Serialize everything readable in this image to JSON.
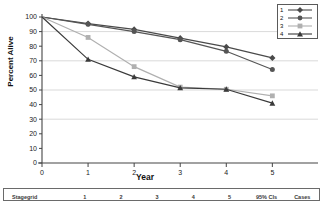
{
  "chart_data": {
    "type": "line",
    "title": "",
    "xlabel": "Year",
    "ylabel": "Percent Alive",
    "x": [
      0,
      1,
      2,
      3,
      4,
      5
    ],
    "xlim": [
      0,
      5.6
    ],
    "ylim": [
      0,
      100
    ],
    "xticks": [
      "0",
      "1",
      "2",
      "3",
      "4",
      "5"
    ],
    "yticks": [
      "0",
      "10",
      "20",
      "30",
      "40",
      "50",
      "60",
      "70",
      "80",
      "90",
      "100"
    ],
    "grid": true,
    "legend_position": "top-right",
    "series": [
      {
        "name": "1",
        "marker": "diamond",
        "color": "#4a4a4a",
        "values": [
          100,
          95.5,
          91.5,
          85.5,
          79.5,
          72
        ]
      },
      {
        "name": "2",
        "marker": "circle",
        "color": "#555555",
        "values": [
          100,
          95.0,
          90.0,
          84.5,
          76.5,
          64
        ]
      },
      {
        "name": "3",
        "marker": "square",
        "color": "#b0b0b0",
        "values": [
          100,
          86,
          66,
          52,
          50.5,
          46
        ]
      },
      {
        "name": "4",
        "marker": "triangle",
        "color": "#3a3a3a",
        "values": [
          100,
          71,
          59,
          51.5,
          50.5,
          41
        ]
      }
    ]
  },
  "legend": {
    "entries": [
      {
        "label": "1"
      },
      {
        "label": "2"
      },
      {
        "label": "3"
      },
      {
        "label": "4"
      }
    ]
  },
  "risk_table": {
    "headers": [
      "Stagegrid",
      "1",
      "2",
      "3",
      "4",
      "5",
      "95% CIs",
      "Cases"
    ]
  }
}
